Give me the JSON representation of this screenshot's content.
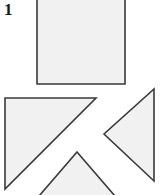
{
  "figure": {
    "label": "1",
    "caption": "",
    "canvas": {
      "width": 160,
      "height": 195
    },
    "colors": {
      "background": "#ffffff",
      "shape_fill": "#f1f1f1",
      "shape_stroke": "#3a3a3a",
      "label_color": "#1a1a1a"
    },
    "shapes": [
      {
        "name": "square",
        "type": "rectangle",
        "points": "37,-8 125,-8 125,84 37,84",
        "note": "large square, top edge cropped by image boundary"
      },
      {
        "name": "large-right-triangle",
        "type": "triangle",
        "points": "5,98 96,98 5,189",
        "note": "right isosceles triangle, right angle at upper-left"
      },
      {
        "name": "left-pointing-triangle",
        "type": "triangle",
        "points": "154,89 154,181 104,134",
        "note": "isosceles triangle pointing left"
      },
      {
        "name": "up-pointing-triangle",
        "type": "triangle",
        "points": "77,152 121,203 33,203",
        "note": "triangle pointing up, bottom cropped by image boundary"
      }
    ]
  }
}
